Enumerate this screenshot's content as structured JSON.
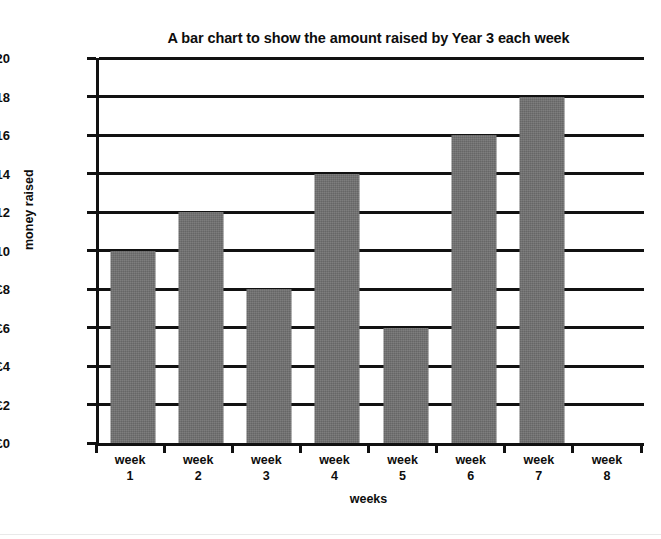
{
  "chart_data": {
    "type": "bar",
    "title": "A bar chart to show the amount raised by Year 3 each week",
    "xlabel": "weeks",
    "ylabel": "money raised",
    "categories": [
      "week 1",
      "week 2",
      "week 3",
      "week 4",
      "week 5",
      "week 6",
      "week 7",
      "week 8"
    ],
    "category_lines": [
      {
        "line1": "week",
        "line2": "1"
      },
      {
        "line1": "week",
        "line2": "2"
      },
      {
        "line1": "week",
        "line2": "3"
      },
      {
        "line1": "week",
        "line2": "4"
      },
      {
        "line1": "week",
        "line2": "5"
      },
      {
        "line1": "week",
        "line2": "6"
      },
      {
        "line1": "week",
        "line2": "7"
      },
      {
        "line1": "week",
        "line2": "8"
      }
    ],
    "values": [
      10,
      12,
      8,
      14,
      6,
      16,
      18,
      0
    ],
    "ylim": [
      0,
      20
    ],
    "ytick_step": 2,
    "ytick_labels": [
      "£0",
      "£2",
      "£4",
      "£6",
      "£8",
      "£10",
      "£12",
      "£14",
      "£16",
      "£18",
      "£20"
    ],
    "ytick_values": [
      0,
      2,
      4,
      6,
      8,
      10,
      12,
      14,
      16,
      18,
      20
    ],
    "currency_symbol": "£",
    "grid": true,
    "legend": false,
    "bar_color": "#6f6f6f",
    "axis_color": "#111111",
    "background_color": "#ffffff"
  }
}
